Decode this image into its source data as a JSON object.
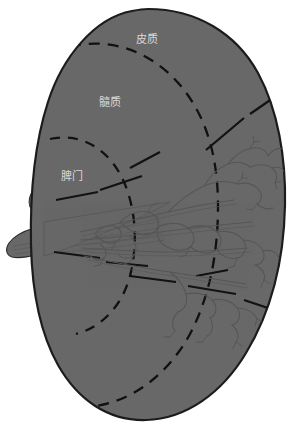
{
  "figure": {
    "type": "anatomical-diagram",
    "background_color": "#ffffff",
    "organ_fill_color": "#686868",
    "organ_outline_color": "#1c1c1c",
    "dashed_zone_color": "#111111",
    "radial_line_color": "#121212",
    "vessel_color": "#565656",
    "label_color": "#d8d8d8"
  },
  "labels": [
    {
      "id": "cortex",
      "text": "皮质",
      "x": 147,
      "y": 40
    },
    {
      "id": "medulla",
      "text": "髓质",
      "x": 110,
      "y": 103
    },
    {
      "id": "hilum",
      "text": "脾门",
      "x": 72,
      "y": 177
    }
  ],
  "regions": [
    {
      "id": "cortex-zone",
      "label": "皮质"
    },
    {
      "id": "medulla-zone",
      "label": "髓质"
    },
    {
      "id": "hilum-zone",
      "label": "脾门"
    }
  ],
  "structures": [
    {
      "id": "organ-body",
      "name": "spleen-body"
    },
    {
      "id": "vascular-pedicle",
      "name": "splenic-pedicle"
    },
    {
      "id": "vessel-tree",
      "name": "intrasplenic-vessel-tree"
    }
  ]
}
